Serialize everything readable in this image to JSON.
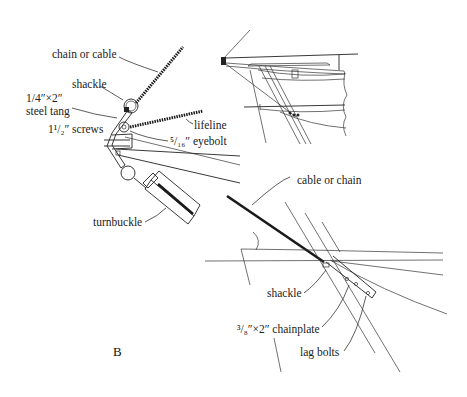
{
  "figure": {
    "panel_label": "B",
    "detail_left": {
      "labels": {
        "chain_or_cable": "chain or cable",
        "shackle": "shackle",
        "tang_line1": "1/4″×2″",
        "tang_line2": "steel tang",
        "screws": "1¹/₂″ screws",
        "lifeline": "lifeline",
        "eyebolt": "⁵/₁₆″ eyebolt",
        "turnbuckle": "turnbuckle"
      }
    },
    "detail_top_right": {
      "description": "hull section with rail, stanchion base and fastened tang"
    },
    "detail_bottom_right": {
      "labels": {
        "cable_or_chain": "cable or chain",
        "shackle": "shackle",
        "chainplate": "³/₈″×2″ chainplate",
        "lag_bolts": "lag bolts"
      }
    }
  }
}
